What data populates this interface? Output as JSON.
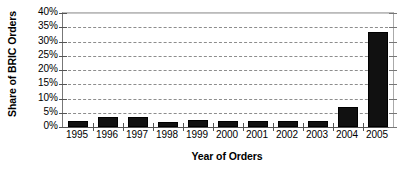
{
  "chart_data": {
    "type": "bar",
    "title": "",
    "xlabel": "Year of Orders",
    "ylabel": "Share of BRIC Orders",
    "categories": [
      "1995",
      "1996",
      "1997",
      "1998",
      "1999",
      "2000",
      "2001",
      "2002",
      "2003",
      "2004",
      "2005"
    ],
    "values": [
      2.2,
      3.5,
      3.6,
      1.9,
      2.6,
      2.2,
      2.2,
      2.2,
      2.1,
      7.0,
      33.5
    ],
    "value_labels": [
      "2.2%",
      "3.5%",
      "3.6%",
      "1.9%",
      "2.6%",
      "2.2%",
      "2.2%",
      "2.2%",
      "2.1%",
      "7.0%",
      "33.5%"
    ],
    "ylim": [
      0,
      40
    ],
    "ytick_values": [
      0,
      5,
      10,
      15,
      20,
      25,
      30,
      35,
      40
    ],
    "ytick_labels": [
      "0%",
      "5%",
      "10%",
      "15%",
      "20%",
      "25%",
      "30%",
      "35%",
      "40%"
    ],
    "grid": true,
    "grid_style": "dashed",
    "legend": false,
    "legend_position": "none",
    "series": [
      {
        "name": "Share of BRIC Orders",
        "values": [
          2.2,
          3.5,
          3.6,
          1.9,
          2.6,
          2.2,
          2.2,
          2.2,
          2.1,
          7.0,
          33.5
        ]
      }
    ],
    "colors": {
      "bar": "#111111",
      "gridline": "#8d8d8d",
      "axis": "#555555",
      "background": "#ffffff",
      "text": "#000000"
    }
  }
}
